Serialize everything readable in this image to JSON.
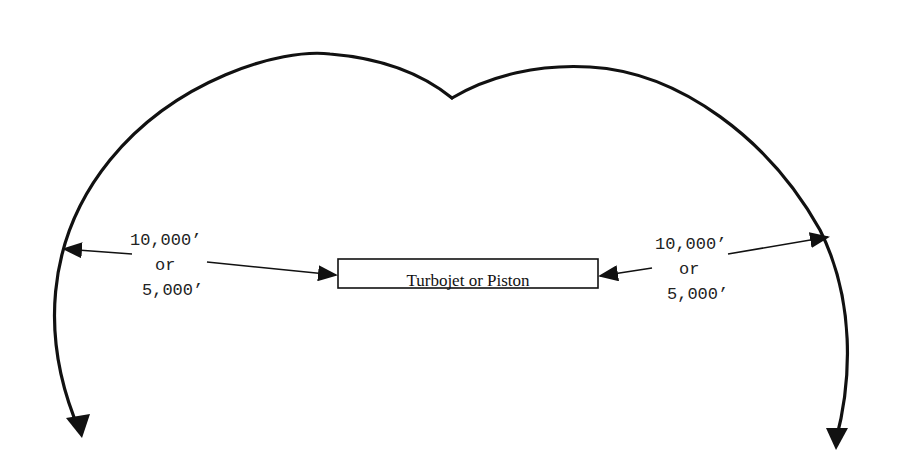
{
  "diagram": {
    "type": "airspace-boundary",
    "center_box": {
      "label": "Turbojet or Piston"
    },
    "left_dimension": {
      "line1": "10,000’",
      "line2": "or",
      "line3": "5,000’"
    },
    "right_dimension": {
      "line1": "10,000’",
      "line2": "or",
      "line3": "5,000’"
    },
    "colors": {
      "stroke": "#111111",
      "text": "#222222",
      "background": "#ffffff"
    }
  }
}
